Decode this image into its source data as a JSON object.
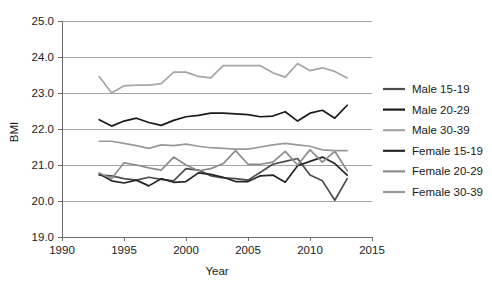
{
  "chart_data": {
    "type": "line",
    "title": "",
    "xlabel": "Year",
    "ylabel": "BMI",
    "xlim": [
      1990,
      2015
    ],
    "ylim": [
      19.0,
      25.0
    ],
    "xticks": [
      1990,
      1995,
      2000,
      2005,
      2010,
      2015
    ],
    "xtick_labels": [
      "1990",
      "1995",
      "2000",
      "2005",
      "2010",
      "2015"
    ],
    "yticks": [
      19.0,
      20.0,
      21.0,
      22.0,
      23.0,
      24.0,
      25.0
    ],
    "ytick_labels": [
      "19.0",
      "20.0",
      "21.0",
      "22.0",
      "23.0",
      "24.0",
      "25.0"
    ],
    "grid": true,
    "grid_axis": "y",
    "legend_position": "right",
    "x": [
      1993,
      1994,
      1995,
      1996,
      1997,
      1998,
      1999,
      2000,
      2001,
      2002,
      2003,
      2004,
      2005,
      2006,
      2007,
      2008,
      2009,
      2010,
      2011,
      2012,
      2013
    ],
    "series": [
      {
        "name": "Male 15-19",
        "color": "#4d4d4d",
        "values": [
          20.72,
          20.7,
          20.62,
          20.58,
          20.66,
          20.6,
          20.56,
          20.9,
          20.86,
          20.7,
          20.64,
          20.62,
          20.58,
          20.8,
          21.02,
          21.1,
          21.18,
          20.72,
          20.56,
          20.02,
          20.62
        ]
      },
      {
        "name": "Male 20-29",
        "color": "#1a1a1a",
        "values": [
          22.26,
          22.08,
          22.22,
          22.3,
          22.18,
          22.1,
          22.24,
          22.34,
          22.38,
          22.44,
          22.44,
          22.42,
          22.4,
          22.34,
          22.36,
          22.48,
          22.22,
          22.44,
          22.52,
          22.3,
          22.66
        ]
      },
      {
        "name": "Male 30-39",
        "color": "#a6a6a6",
        "values": [
          23.46,
          23.0,
          23.2,
          23.22,
          23.22,
          23.26,
          23.58,
          23.58,
          23.46,
          23.42,
          23.76,
          23.76,
          23.76,
          23.76,
          23.56,
          23.44,
          23.82,
          23.62,
          23.7,
          23.6,
          23.42
        ]
      },
      {
        "name": "Female 15-19",
        "color": "#262626",
        "values": [
          20.76,
          20.56,
          20.5,
          20.58,
          20.42,
          20.62,
          20.52,
          20.54,
          20.78,
          20.74,
          20.66,
          20.54,
          20.54,
          20.7,
          20.72,
          20.52,
          20.98,
          21.1,
          21.22,
          21.04,
          20.72
        ]
      },
      {
        "name": "Female 20-29",
        "color": "#8c8c8c",
        "values": [
          20.78,
          20.62,
          21.06,
          21.0,
          20.92,
          20.86,
          21.22,
          21.0,
          20.84,
          20.9,
          21.04,
          21.4,
          21.02,
          21.02,
          21.08,
          21.38,
          21.0,
          21.42,
          21.08,
          21.38,
          20.84
        ]
      },
      {
        "name": "Female 30-39",
        "color": "#999999",
        "values": [
          21.66,
          21.66,
          21.6,
          21.54,
          21.46,
          21.56,
          21.54,
          21.58,
          21.52,
          21.48,
          21.46,
          21.44,
          21.44,
          21.5,
          21.56,
          21.6,
          21.56,
          21.52,
          21.42,
          21.4,
          21.4
        ]
      }
    ]
  },
  "legend": {
    "items": [
      {
        "label": "Male 15-19",
        "color": "#4d4d4d"
      },
      {
        "label": "Male 20-29",
        "color": "#1a1a1a"
      },
      {
        "label": "Male 30-39",
        "color": "#a6a6a6"
      },
      {
        "label": "Female 15-19",
        "color": "#262626"
      },
      {
        "label": "Female 20-29",
        "color": "#8c8c8c"
      },
      {
        "label": "Female 30-39",
        "color": "#999999"
      }
    ]
  }
}
